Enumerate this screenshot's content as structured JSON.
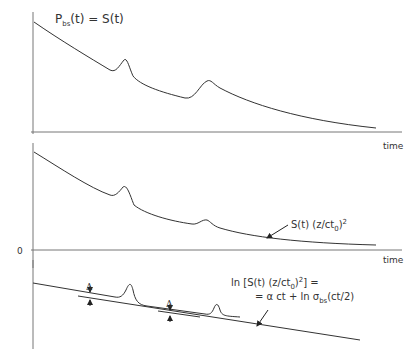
{
  "panel1": {
    "title_main": "P",
    "title_sub": "bs",
    "title_rest": "(t) = S(t)",
    "xlabel": "time"
  },
  "panel2": {
    "zero_label": "0",
    "xlabel": "time",
    "annotation_main": "S(t)  (z/ct",
    "annotation_sub": "0",
    "annotation_close": ")",
    "annotation_sup": "2"
  },
  "panel3": {
    "delta_label_1": "Δ",
    "delta_label_2": "Δ",
    "eq_line1_a": "ln [S(t) (z/ct",
    "eq_line1_sub": "0",
    "eq_line1_b": ")",
    "eq_line1_sup": "2",
    "eq_line1_c": "] =",
    "eq_line2_a": "= α ct  + ln σ",
    "eq_line2_sub": "bs",
    "eq_line2_b": "(ct/2)"
  },
  "colors": {
    "line": "#333333",
    "axis": "#777777"
  }
}
